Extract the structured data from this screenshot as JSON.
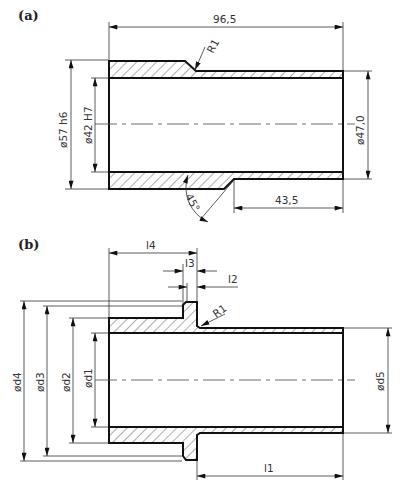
{
  "figure": {
    "panels": [
      {
        "id": "a",
        "label": "(a)",
        "dimensions": {
          "overall_length": "96,5",
          "outer_diameter": "ø57 h6",
          "bore_diameter": "ø42 H7",
          "reduced_outer_diameter": "ø47,0",
          "reduced_section_length": "43,5",
          "fillet_radius": "R1",
          "chamfer_angle": "45°"
        }
      },
      {
        "id": "b",
        "label": "(b)",
        "dimensions": {
          "l1": "l1",
          "l2": "l2",
          "l3": "l3",
          "l4": "l4",
          "d1": "ød1",
          "d2": "ød2",
          "d3": "ød3",
          "d4": "ød4",
          "d5": "ød5",
          "fillet_radius": "R1"
        }
      }
    ]
  },
  "colors": {
    "line": "#111111",
    "dimension": "#333333",
    "background": "#ffffff"
  }
}
